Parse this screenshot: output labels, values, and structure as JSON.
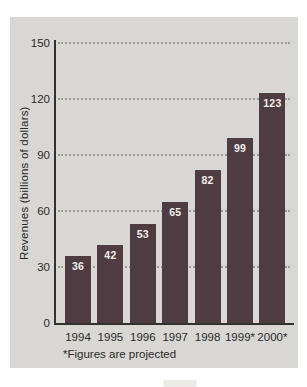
{
  "chart_data": {
    "type": "bar",
    "categories": [
      "1994",
      "1995",
      "1996",
      "1997",
      "1998",
      "1999*",
      "2000*"
    ],
    "values": [
      36,
      42,
      53,
      65,
      82,
      99,
      123
    ],
    "title": "",
    "xlabel": "",
    "ylabel": "Revenues (billions of dollars)",
    "ylim": [
      0,
      150
    ],
    "yticks": [
      0,
      30,
      60,
      90,
      120,
      150
    ],
    "grid": "horizontal-dotted",
    "legend": "none",
    "show_value_labels": true,
    "footnote": "*Figures are projected",
    "colors": {
      "bar": "#4f3c42",
      "value_label": "#f4efec",
      "panel_bg": "#d8d7d3",
      "page_bg": "#ffffff",
      "axis": "#33312f",
      "grid": "#9e9d99",
      "text": "#2b2928"
    }
  }
}
